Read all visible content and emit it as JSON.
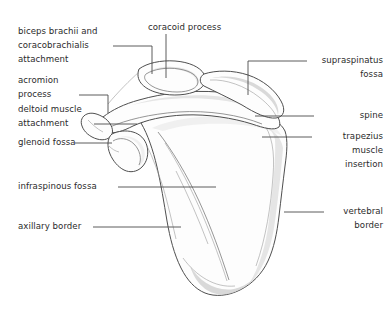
{
  "figure": {
    "background_color": "#ffffff",
    "line_color": "#4f4f4f",
    "text_color": "#2b2b2b"
  },
  "labels": {
    "biceps_coracobrachialis": "biceps brachii and\ncoracobrachialis\nattachment",
    "acromion_process": "acromion\nprocess",
    "deltoid_attachment": "deltoid muscle\nattachment",
    "glenoid_fossa": "glenoid fossa",
    "infraspinous_fossa": "infraspinous fossa",
    "axillary_border": "axillary border",
    "coracoid_process": "coracoid process",
    "supraspinatus_fossa": "supraspinatus\nfossa",
    "spine": "spine",
    "trapezius_insertion": "trapezius\nmuscle\ninsertion",
    "vertebral_border": "vertebral\nborder"
  }
}
